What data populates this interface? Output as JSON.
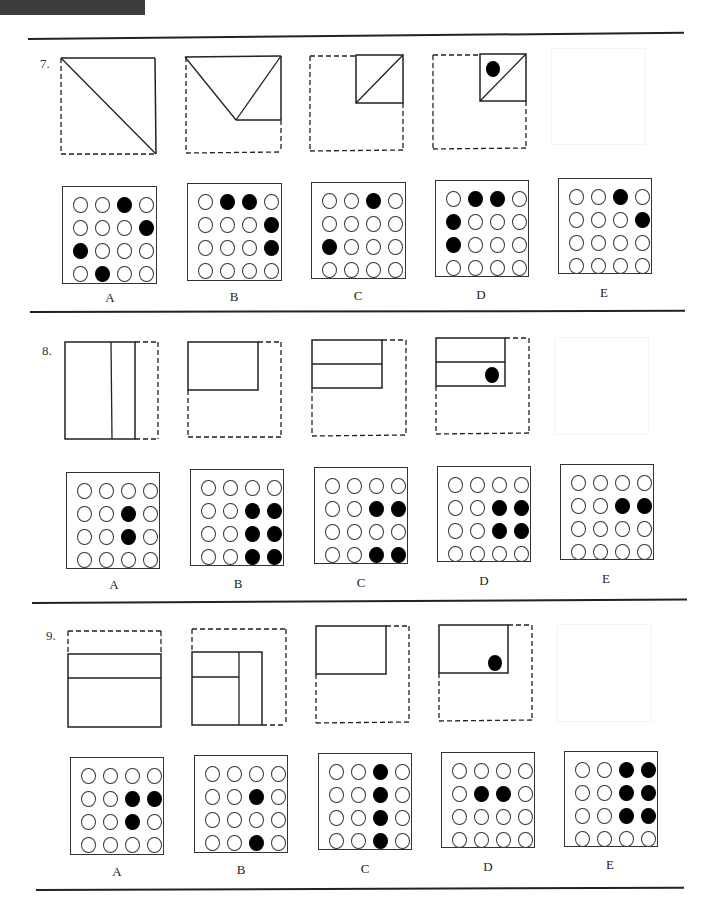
{
  "page": {
    "header_bar_color": "#3d3d3d",
    "rule_color": "#222222"
  },
  "questions": [
    {
      "number": "7.",
      "folding_steps": [
        {
          "step": 1,
          "description": "square folded along diagonal from top-left to bottom-right",
          "hole": false
        },
        {
          "step": 2,
          "description": "folded into top half with V-shaped diagonal folds",
          "hole": false
        },
        {
          "step": 3,
          "description": "folded into small top-right square with diagonal",
          "hole": false
        },
        {
          "step": 4,
          "description": "small top-right square with diagonal and punched hole",
          "hole": true
        }
      ],
      "options": [
        {
          "label": "A",
          "grid": [
            [
              0,
              0,
              1,
              0
            ],
            [
              0,
              0,
              0,
              1
            ],
            [
              1,
              0,
              0,
              0
            ],
            [
              0,
              1,
              0,
              0
            ]
          ]
        },
        {
          "label": "B",
          "grid": [
            [
              0,
              1,
              1,
              0
            ],
            [
              0,
              0,
              0,
              1
            ],
            [
              0,
              0,
              0,
              1
            ],
            [
              0,
              0,
              0,
              0
            ]
          ]
        },
        {
          "label": "C",
          "grid": [
            [
              0,
              0,
              1,
              0
            ],
            [
              0,
              0,
              0,
              0
            ],
            [
              1,
              0,
              0,
              0
            ],
            [
              0,
              0,
              0,
              0
            ]
          ]
        },
        {
          "label": "D",
          "grid": [
            [
              0,
              1,
              1,
              0
            ],
            [
              1,
              0,
              0,
              0
            ],
            [
              1,
              0,
              0,
              0
            ],
            [
              0,
              0,
              0,
              0
            ]
          ]
        },
        {
          "label": "E",
          "grid": [
            [
              0,
              0,
              1,
              0
            ],
            [
              0,
              0,
              0,
              1
            ],
            [
              0,
              0,
              0,
              0
            ],
            [
              0,
              0,
              0,
              0
            ]
          ]
        }
      ]
    },
    {
      "number": "8.",
      "folding_steps": [
        {
          "step": 1,
          "description": "right strip folded over with vertical crease",
          "hole": false
        },
        {
          "step": 2,
          "description": "folded into top-left rectangle",
          "hole": false
        },
        {
          "step": 3,
          "description": "top-left rectangle with horizontal crease",
          "hole": false
        },
        {
          "step": 4,
          "description": "top-left rectangle with horizontal crease and punched hole",
          "hole": true
        }
      ],
      "options": [
        {
          "label": "A",
          "grid": [
            [
              0,
              0,
              0,
              0
            ],
            [
              0,
              0,
              1,
              0
            ],
            [
              0,
              0,
              1,
              0
            ],
            [
              0,
              0,
              0,
              0
            ]
          ]
        },
        {
          "label": "B",
          "grid": [
            [
              0,
              0,
              0,
              0
            ],
            [
              0,
              0,
              1,
              1
            ],
            [
              0,
              0,
              1,
              1
            ],
            [
              0,
              0,
              1,
              1
            ]
          ]
        },
        {
          "label": "C",
          "grid": [
            [
              0,
              0,
              0,
              0
            ],
            [
              0,
              0,
              1,
              1
            ],
            [
              0,
              0,
              0,
              0
            ],
            [
              0,
              0,
              1,
              1
            ]
          ]
        },
        {
          "label": "D",
          "grid": [
            [
              0,
              0,
              0,
              0
            ],
            [
              0,
              0,
              1,
              1
            ],
            [
              0,
              0,
              1,
              1
            ],
            [
              0,
              0,
              0,
              0
            ]
          ]
        },
        {
          "label": "E",
          "grid": [
            [
              0,
              0,
              0,
              0
            ],
            [
              0,
              0,
              1,
              1
            ],
            [
              0,
              0,
              0,
              0
            ],
            [
              0,
              0,
              0,
              0
            ]
          ]
        }
      ]
    },
    {
      "number": "9.",
      "folding_steps": [
        {
          "step": 1,
          "description": "top strip folded down with horizontal crease",
          "hole": false
        },
        {
          "step": 2,
          "description": "right strip folded with vertical crease",
          "hole": false
        },
        {
          "step": 3,
          "description": "folded into top-left rectangle",
          "hole": false
        },
        {
          "step": 4,
          "description": "top-left rectangle with punched hole",
          "hole": true
        }
      ],
      "options": [
        {
          "label": "A",
          "grid": [
            [
              0,
              0,
              0,
              0
            ],
            [
              0,
              0,
              1,
              1
            ],
            [
              0,
              0,
              1,
              0
            ],
            [
              0,
              0,
              0,
              0
            ]
          ]
        },
        {
          "label": "B",
          "grid": [
            [
              0,
              0,
              0,
              0
            ],
            [
              0,
              0,
              1,
              0
            ],
            [
              0,
              0,
              0,
              0
            ],
            [
              0,
              0,
              1,
              0
            ]
          ]
        },
        {
          "label": "C",
          "grid": [
            [
              0,
              0,
              1,
              0
            ],
            [
              0,
              0,
              1,
              0
            ],
            [
              0,
              0,
              1,
              0
            ],
            [
              0,
              0,
              1,
              0
            ]
          ]
        },
        {
          "label": "D",
          "grid": [
            [
              0,
              0,
              0,
              0
            ],
            [
              0,
              1,
              1,
              0
            ],
            [
              0,
              0,
              0,
              0
            ],
            [
              0,
              0,
              0,
              0
            ]
          ]
        },
        {
          "label": "E",
          "grid": [
            [
              0,
              0,
              1,
              1
            ],
            [
              0,
              0,
              1,
              1
            ],
            [
              0,
              0,
              1,
              1
            ],
            [
              0,
              0,
              0,
              0
            ]
          ]
        }
      ]
    }
  ]
}
